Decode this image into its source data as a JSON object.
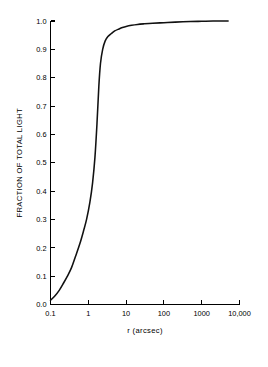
{
  "chart_data": {
    "type": "line",
    "title": "",
    "subtitle": "",
    "xlabel": "r (arcsec)",
    "ylabel": "FRACTION OF TOTAL LIGHT",
    "xscale": "log",
    "yscale": "linear",
    "xlim": [
      0.1,
      10000
    ],
    "ylim": [
      0.0,
      1.0
    ],
    "grid": false,
    "legend": null,
    "annotations": [],
    "xticks": [
      0.1,
      1,
      10,
      100,
      1000,
      10000
    ],
    "xtick_labels": [
      "0.1",
      "1",
      "10",
      "100",
      "1000",
      "10,000"
    ],
    "yticks": [
      0.0,
      0.1,
      0.2,
      0.3,
      0.4,
      0.5,
      0.6,
      0.7,
      0.8,
      0.9,
      1.0
    ],
    "ytick_labels": [
      "0.0",
      "0.1",
      "0.2",
      "0.3",
      "0.4",
      "0.5",
      "0.6",
      "0.7",
      "0.8",
      "0.9",
      "1.0"
    ],
    "series": [
      {
        "name": "cumulative light profile",
        "color": "#111111",
        "x": [
          0.1,
          0.13,
          0.17,
          0.22,
          0.28,
          0.36,
          0.46,
          0.6,
          0.75,
          0.9,
          1.1,
          1.3,
          1.5,
          1.7,
          1.9,
          2.1,
          2.4,
          2.8,
          3.3,
          4.0,
          5.0,
          6.5,
          8.0,
          10.0,
          14.0,
          20.0,
          30.0,
          50.0,
          100.0,
          200.0,
          500.0,
          1000.0,
          2000.0,
          5000.0
        ],
        "y": [
          0.015,
          0.03,
          0.05,
          0.075,
          0.1,
          0.13,
          0.17,
          0.215,
          0.26,
          0.3,
          0.36,
          0.43,
          0.52,
          0.64,
          0.77,
          0.85,
          0.9,
          0.93,
          0.945,
          0.955,
          0.965,
          0.972,
          0.977,
          0.981,
          0.985,
          0.988,
          0.99,
          0.992,
          0.994,
          0.996,
          0.998,
          0.999,
          1.0,
          1.0
        ]
      }
    ]
  },
  "axes": {
    "y_title": "FRACTION OF TOTAL LIGHT",
    "x_title": "r (arcsec)"
  },
  "ticks": {
    "y": [
      "1.0",
      "0.9",
      "0.8",
      "0.7",
      "0.6",
      "0.5",
      "0.4",
      "0.3",
      "0.2",
      "0.1",
      "0.0"
    ],
    "x": [
      "0.1",
      "1",
      "10",
      "100",
      "1000",
      "10,000"
    ]
  }
}
